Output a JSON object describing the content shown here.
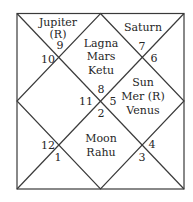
{
  "chart_type": "North Indian birth chart",
  "colors": {
    "line": "#3a3a3a",
    "text": "#262626",
    "background": "#ffffff"
  },
  "houses": {
    "top_left": {
      "planets": [
        "Jupiter",
        "(R)"
      ],
      "sign_a": "9",
      "sign_b": "10"
    },
    "top_center": {
      "planets": [
        "Lagna",
        "Mars",
        "Ketu"
      ],
      "sign": "8"
    },
    "top_right": {
      "planets": [
        "Saturn"
      ],
      "sign_a": "7",
      "sign_b": "6"
    },
    "left_center": {
      "planets": [],
      "sign": "11"
    },
    "right_center": {
      "planets": [
        "Sun",
        "Mer (R)",
        "Venus"
      ],
      "sign": "5"
    },
    "bottom_center": {
      "planets": [
        "Moon",
        "Rahu"
      ],
      "sign": "2"
    },
    "bottom_left": {
      "planets": [],
      "sign_a": "12",
      "sign_b": "1"
    },
    "bottom_right": {
      "planets": [],
      "sign_a": "4",
      "sign_b": "3"
    }
  }
}
